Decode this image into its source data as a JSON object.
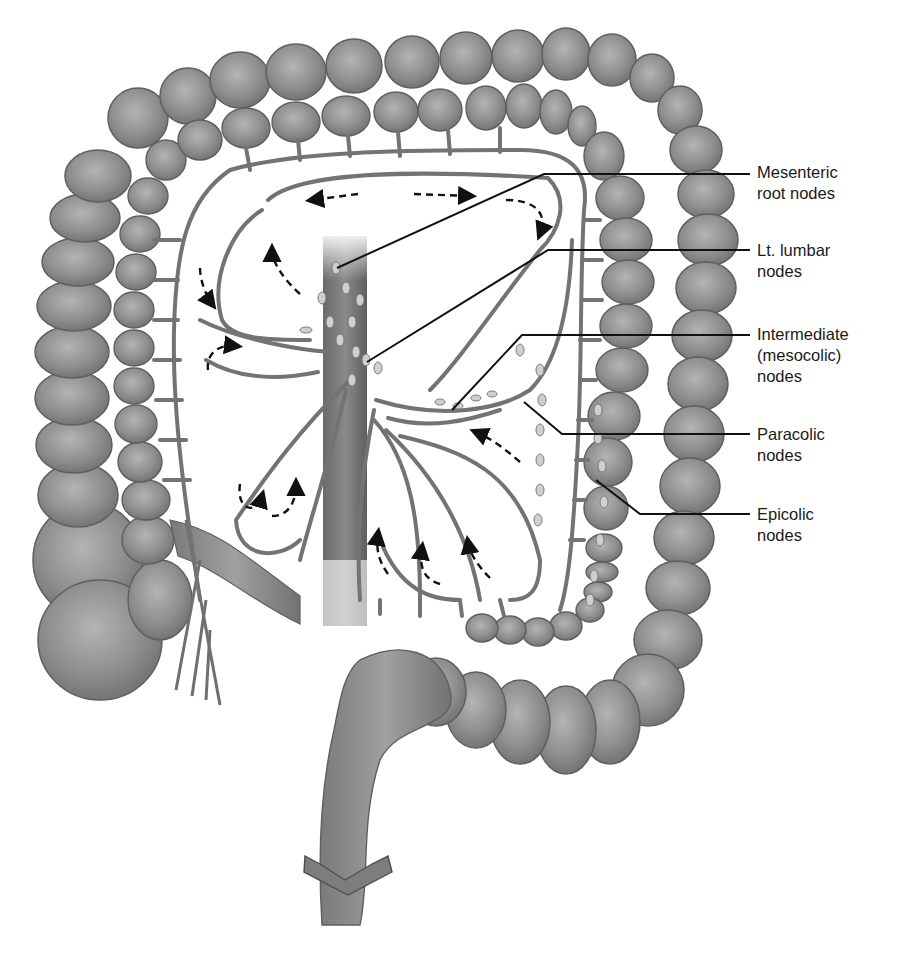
{
  "figure": {
    "colors": {
      "colon": "#8c8c8c",
      "colon_outline": "#5a5a5a",
      "vessel": "#7a7a7a",
      "node": "#c8c8c8",
      "leader_line": "#111111",
      "arrow": "#111111",
      "background": "#ffffff"
    }
  },
  "labels": [
    {
      "id": "mesenteric-root",
      "text": "Mesenteric\nroot nodes",
      "top": 162
    },
    {
      "id": "lt-lumbar",
      "text": "Lt. lumbar\nnodes",
      "top": 248
    },
    {
      "id": "intermediate",
      "text": "Intermediate\n(mesocolic)\nnodes",
      "top": 328
    },
    {
      "id": "paracolic",
      "text": "Paracolic\nnodes",
      "top": 430
    },
    {
      "id": "epicolic",
      "text": "Epicolic\nnodes",
      "top": 512
    }
  ]
}
